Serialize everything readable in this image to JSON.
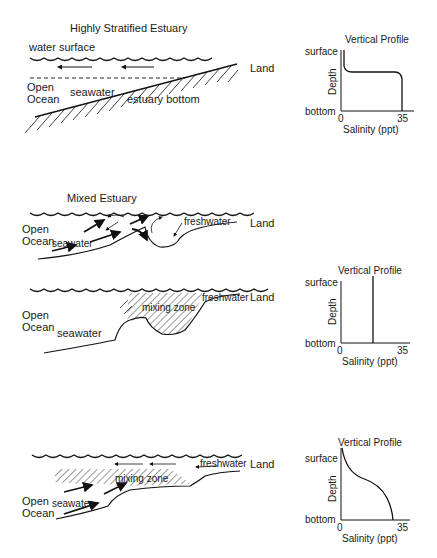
{
  "panels": [
    {
      "title": "Highly Stratified Estuary",
      "labels": {
        "water_surface": "water surface",
        "open": "Open",
        "ocean": "Ocean",
        "seawater": "seawater",
        "estuary_bottom": "estuary bottom",
        "land": "Land"
      },
      "profile": {
        "title": "Vertical Profile",
        "y_top": "surface",
        "y_bottom": "bottom",
        "y_axis": "Depth",
        "x_axis": "Salinity (ppt)",
        "x_min": "0",
        "x_max": "35"
      }
    },
    {
      "title": "Mixed Estuary",
      "labels": {
        "open": "Open",
        "ocean": "Ocean",
        "seawater": "seawater",
        "freshwater": "freshwater",
        "land": "Land"
      },
      "lower_labels": {
        "open": "Open",
        "ocean": "Ocean",
        "seawater": "seawater",
        "freshwater": "freshwater",
        "mixing_zone": "mixing zone",
        "land": "Land"
      },
      "profile": {
        "title": "Vertical Profile",
        "y_top": "surface",
        "y_bottom": "bottom",
        "y_axis": "Depth",
        "x_axis": "Salinity (ppt)",
        "x_min": "0",
        "x_max": "35"
      }
    },
    {
      "title": "",
      "labels": {
        "open": "Open",
        "ocean": "Ocean",
        "seawater": "seawater",
        "freshwater": "freshwater",
        "mixing_zone": "mixing zone",
        "land": "Land"
      },
      "profile": {
        "title": "Vertical Profile",
        "y_top": "surface",
        "y_bottom": "bottom",
        "y_axis": "Depth",
        "x_axis": "Salinity (ppt)",
        "x_min": "0",
        "x_max": "35"
      }
    }
  ]
}
